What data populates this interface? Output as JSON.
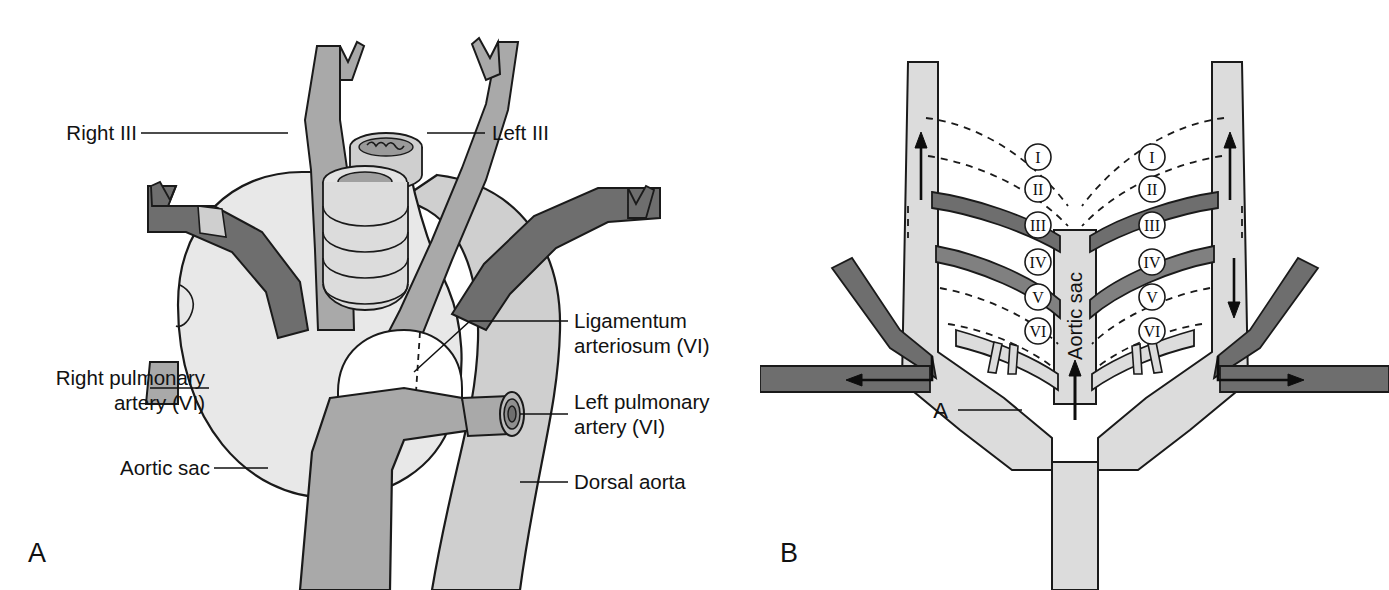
{
  "figure": {
    "panels": [
      {
        "id": "A",
        "letter": "A",
        "caption": "Ventral view of the great vessels derived from the aortic arches"
      },
      {
        "id": "B",
        "letter": "B",
        "caption": "Schematic of the six pairs of pharyngeal arch arteries and the aortic sac"
      }
    ]
  },
  "panel_a": {
    "letter": "A",
    "labels": {
      "right_iii": "Right III",
      "left_iii": "Left III",
      "ligamentum": {
        "line1": "Ligamentum",
        "line2": "arteriosum (VI)"
      },
      "right_pulmonary": {
        "line1": "Right pulmonary",
        "line2": "artery (VI)"
      },
      "left_pulmonary": {
        "line1": "Left pulmonary",
        "line2": "artery (VI)"
      },
      "aortic_sac": "Aortic sac",
      "dorsal_aorta": "Dorsal aorta"
    },
    "structures": [
      {
        "name": "right-common-carotid",
        "shade": "mid-grey"
      },
      {
        "name": "left-common-carotid",
        "shade": "mid-grey"
      },
      {
        "name": "right-subclavian-artery",
        "shade": "dark-grey"
      },
      {
        "name": "left-subclavian-artery",
        "shade": "dark-grey"
      },
      {
        "name": "trachea",
        "shade": "light-grey"
      },
      {
        "name": "esophagus",
        "shade": "light-grey"
      },
      {
        "name": "aortic-sac",
        "shade": "pale-grey"
      },
      {
        "name": "pulmonary-trunk",
        "shade": "mid-grey"
      },
      {
        "name": "dorsal-aorta",
        "shade": "light-grey"
      },
      {
        "name": "right-pulmonary-artery-stump",
        "shade": "mid-grey"
      },
      {
        "name": "left-pulmonary-artery-stump",
        "shade": "mid-grey"
      },
      {
        "name": "ligamentum-arteriosum",
        "shade": "white"
      }
    ]
  },
  "panel_b": {
    "letter": "B",
    "labels": {
      "aortic_sac": "Aortic sac",
      "a_marker": "A"
    },
    "arch_numerals_left": [
      "I",
      "II",
      "III",
      "IV",
      "V",
      "VI"
    ],
    "arch_numerals_right": [
      "I",
      "II",
      "III",
      "IV",
      "V",
      "VI"
    ],
    "arch_styles": [
      {
        "numeral": "I",
        "style": "regressed-dashed"
      },
      {
        "numeral": "II",
        "style": "regressed-dashed"
      },
      {
        "numeral": "III",
        "style": "persistent-dark"
      },
      {
        "numeral": "IV",
        "style": "persistent-dark"
      },
      {
        "numeral": "V",
        "style": "regressed-dashed"
      },
      {
        "numeral": "VI",
        "style": "partial-light"
      }
    ],
    "flow_arrows": [
      {
        "name": "aortic-sac-inflow",
        "direction": "up"
      },
      {
        "name": "left-dorsal-aorta-flow",
        "direction": "up"
      },
      {
        "name": "right-dorsal-aorta-flow",
        "direction": "up"
      },
      {
        "name": "left-subclavian-flow",
        "direction": "right"
      },
      {
        "name": "right-subclavian-flow",
        "direction": "left"
      },
      {
        "name": "descending-flow",
        "direction": "down"
      }
    ]
  },
  "colors": {
    "pale_grey": "#e8e8e8",
    "light_grey": "#cfcfcf",
    "mid_grey": "#a9a9a9",
    "dark_grey": "#6e6e6e",
    "outline": "#1a1a1a",
    "white": "#ffffff",
    "text": "#111111"
  }
}
